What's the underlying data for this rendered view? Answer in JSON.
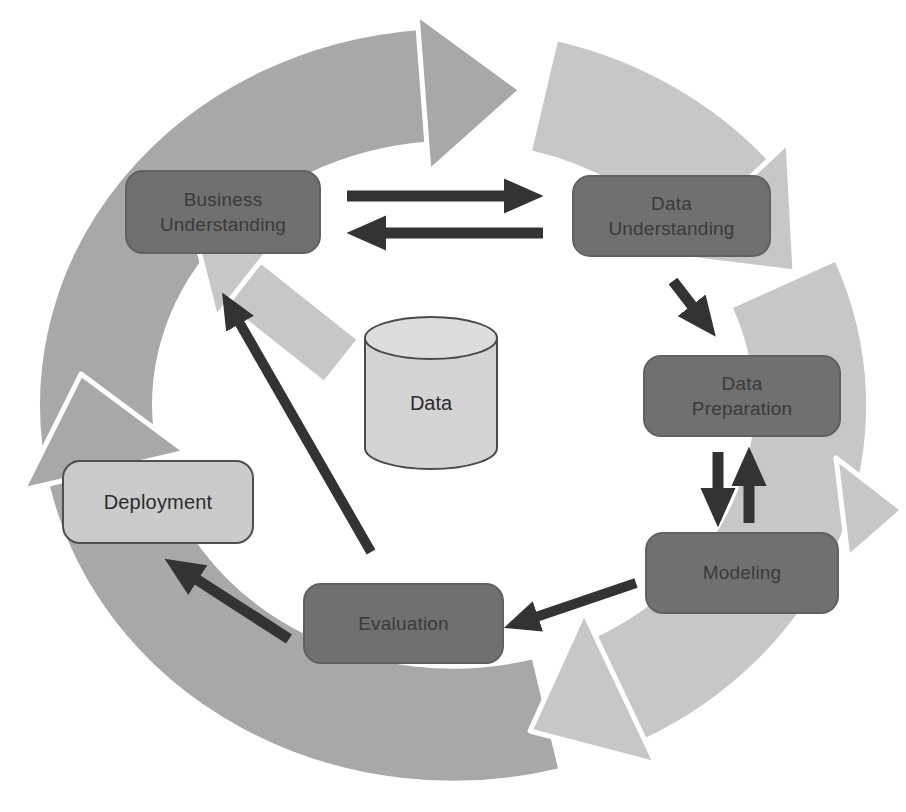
{
  "colors": {
    "background": "#ffffff",
    "ring_medium": "#a8a8a8",
    "ring_light": "#c7c7c7",
    "ring_outline": "#ffffff",
    "node_fill_dark": "#707070",
    "node_border_dark": "#616161",
    "node_text_dark": "#3a3a3a",
    "node_fill_light": "#cbcbcb",
    "node_border_light": "#4f4f4f",
    "node_text_light": "#2b2b2b",
    "cylinder_fill": "#d4d4d4",
    "cylinder_top_fill": "#dddddd",
    "cylinder_stroke": "#4a4a4a",
    "connector": "#333333"
  },
  "diagram": {
    "type": "cycle-flowchart",
    "nodes": [
      {
        "id": "business-understanding",
        "label": "Business\nUnderstanding",
        "style": "dark"
      },
      {
        "id": "data-understanding",
        "label": "Data\nUnderstanding",
        "style": "dark"
      },
      {
        "id": "data-preparation",
        "label": "Data\nPreparation",
        "style": "dark"
      },
      {
        "id": "modeling",
        "label": "Modeling",
        "style": "dark"
      },
      {
        "id": "evaluation",
        "label": "Evaluation",
        "style": "dark"
      },
      {
        "id": "deployment",
        "label": "Deployment",
        "style": "light"
      }
    ],
    "data_store": {
      "label": "Data"
    },
    "edges": [
      {
        "from": "business-understanding",
        "to": "data-understanding",
        "bidirectional": true
      },
      {
        "from": "data-understanding",
        "to": "data-preparation",
        "bidirectional": false
      },
      {
        "from": "data-preparation",
        "to": "modeling",
        "bidirectional": true
      },
      {
        "from": "modeling",
        "to": "evaluation",
        "bidirectional": false
      },
      {
        "from": "evaluation",
        "to": "deployment",
        "bidirectional": false
      },
      {
        "from": "evaluation",
        "to": "business-understanding",
        "bidirectional": false
      }
    ],
    "outer_cycle": {
      "shape": "ring-of-arrows",
      "direction": "clockwise"
    }
  }
}
